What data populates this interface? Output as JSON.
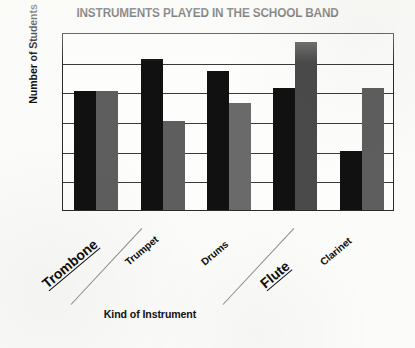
{
  "chart_data": {
    "type": "bar",
    "title": "INSTRUMENTS PLAYED IN THE SCHOOL BAND",
    "xlabel": "Kind of Instrument",
    "ylabel": "Number of Students",
    "categories": [
      "Trombone",
      "Trumpet",
      "Drums",
      "Flute",
      "Clarinet"
    ],
    "series": [
      {
        "name": "series-1",
        "color": "#111111",
        "values": [
          8.0,
          10.2,
          9.4,
          8.2,
          4.0
        ]
      },
      {
        "name": "series-2",
        "color": "#5e5e5e",
        "values": [
          8.0,
          6.0,
          7.2,
          11.3,
          8.2
        ]
      }
    ],
    "ylim": [
      0,
      12
    ],
    "yticks": [
      0,
      2,
      4,
      6,
      8,
      10,
      12
    ],
    "ytick_labels": [
      "0",
      "2",
      "4",
      "6",
      "8",
      "10",
      "12"
    ],
    "grid": true,
    "legend": "none",
    "xtick_rotation_deg": -40,
    "emphasized_categories": [
      "Trombone",
      "Flute"
    ],
    "annotations": [
      "diagonal-stroke-near-trombone",
      "diagonal-stroke-near-flute"
    ]
  },
  "bar_colors": {
    "series_1": "#111111",
    "series_2": "#5e5e5e",
    "flute_series_2": "#4a4a4a",
    "drums_series_2": "#6a6a6a"
  }
}
